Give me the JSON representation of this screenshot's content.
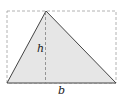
{
  "diagram": {
    "labels": {
      "height": "h",
      "base": "b"
    },
    "colors": {
      "fill": "#e6e6e6",
      "stroke": "#444444",
      "dashed": "#a0a0a0"
    },
    "shapes": {
      "rectangle": {
        "type": "dashed-bounding-rectangle"
      },
      "triangle": {
        "vertices": [
          "bottom-left",
          "top-apex",
          "bottom-right"
        ]
      },
      "altitude": {
        "type": "dashed-vertical-line",
        "from": "apex",
        "to": "base"
      }
    }
  }
}
